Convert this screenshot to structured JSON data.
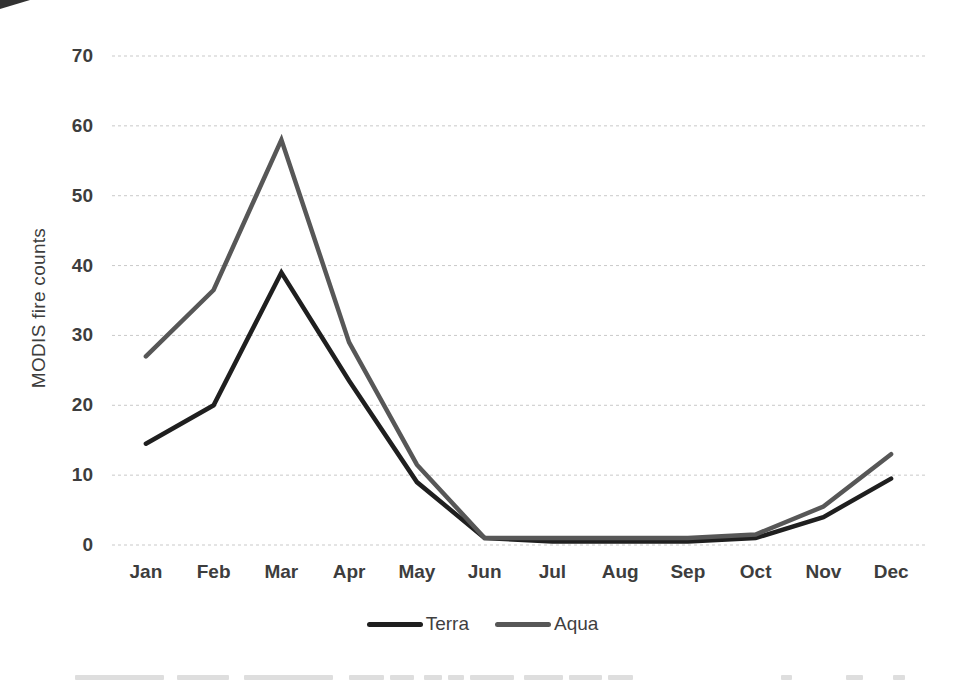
{
  "colors": {
    "background": "#ffffff",
    "text": "#3d3d3d",
    "grid": "#c9c9c9",
    "terra_line": "#1f1f1f",
    "aqua_line": "#575757"
  },
  "chart_data": {
    "type": "line",
    "title": "",
    "xlabel": "",
    "ylabel": "MODIS fire counts",
    "categories": [
      "Jan",
      "Feb",
      "Mar",
      "Apr",
      "May",
      "Jun",
      "Jul",
      "Aug",
      "Sep",
      "Oct",
      "Nov",
      "Dec"
    ],
    "series": [
      {
        "name": "Terra",
        "color": "#1f1f1f",
        "values": [
          14.5,
          20,
          39,
          23.5,
          9,
          1,
          0.5,
          0.5,
          0.5,
          1,
          4,
          9.5
        ]
      },
      {
        "name": "Aqua",
        "color": "#575757",
        "values": [
          27,
          36.5,
          58,
          29,
          11.5,
          1,
          1,
          1,
          1,
          1.5,
          5.5,
          13
        ]
      }
    ],
    "ylim": [
      0,
      70
    ],
    "yticks": [
      0,
      10,
      20,
      30,
      40,
      50,
      60,
      70
    ],
    "grid": "horizontal-dashed",
    "legend_position": "bottom",
    "legend_labels": [
      "Terra",
      "Aqua"
    ]
  }
}
